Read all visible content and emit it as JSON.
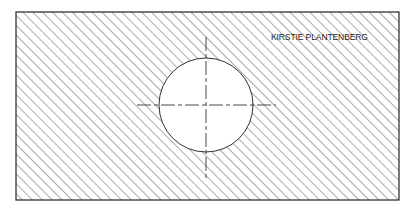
{
  "drawing": {
    "type": "section-view",
    "title": "KIRSTIE PLANTENBERG",
    "plate": {
      "x": 16,
      "y": 12,
      "width": 383,
      "height": 188,
      "stroke": "#333333"
    },
    "hatch": {
      "angle_deg": 45,
      "spacing": 7,
      "color": "#555555"
    },
    "hole": {
      "cx": 206,
      "cy": 105,
      "r": 47,
      "fill": "#ffffff"
    },
    "centerlines": {
      "horizontal": {
        "x1": 137,
        "x2": 276,
        "y": 105
      },
      "vertical": {
        "x": 206,
        "y1": 37,
        "y2": 178
      },
      "dash": "14 3 4 3"
    }
  }
}
